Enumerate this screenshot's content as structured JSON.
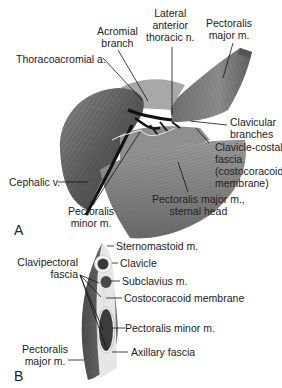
{
  "figure": {
    "panels": [
      {
        "id": "A",
        "label": "A",
        "labels": {
          "acromial_branch": [
            "Acromial",
            "branch"
          ],
          "lateral_anterior_thoracic": [
            "Lateral",
            "anterior",
            "thoracic n."
          ],
          "pectoralis_major": [
            "Pectoralis",
            "major m."
          ],
          "thoracoacromial": "Thoracoacromial a.",
          "clavicular_branches": [
            "Clavicular",
            "branches"
          ],
          "clavicle_costal_fascia": [
            "Clavicle-costal",
            "fascia",
            "(costocoracoid",
            "membrane)"
          ],
          "cephalic_v": "Cephalic v.",
          "pectoralis_major_sternal": [
            "Pectoralis major m.,",
            "sternal head"
          ],
          "pectoralis_minor": [
            "Pectoralis",
            "minor m."
          ]
        }
      },
      {
        "id": "B",
        "label": "B",
        "labels": {
          "sternomastoid": "Sternomastoid m.",
          "clavicle": "Clavicle",
          "clavipectoral_fascia": [
            "Clavipectoral",
            "fascia"
          ],
          "subclavius": "Subclavius m.",
          "costocoracoid_membrane": "Costocoracoid membrane",
          "pectoralis_minor": "Pectoralis minor m.",
          "pectoralis_major": [
            "Pectoralis",
            "major m."
          ],
          "axillary_fascia": "Axillary fascia"
        }
      }
    ],
    "colors": {
      "muscle_dark": "#4a4a4a",
      "muscle_mid": "#7a7a7a",
      "muscle_light": "#b5b5b5",
      "fascia": "#e6e6e6",
      "line": "#111111"
    }
  }
}
